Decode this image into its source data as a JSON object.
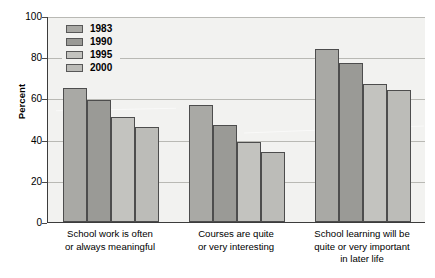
{
  "chart_data": {
    "type": "bar",
    "title": "",
    "xlabel": "",
    "ylabel": "Percent",
    "ylim": [
      0,
      100
    ],
    "yticks": [
      0,
      20,
      40,
      60,
      80,
      100
    ],
    "grid": true,
    "legend_position": "top-left inside plot",
    "categories": [
      "School work is often\nor always meaningful",
      "Courses are quite\nor very interesting",
      "School learning will be\nquite or very important\nin later life"
    ],
    "category_lines": [
      [
        "School work is often",
        "or always meaningful"
      ],
      [
        "Courses are quite",
        "or very interesting"
      ],
      [
        "School learning will be",
        "quite or very important",
        "in later life"
      ]
    ],
    "series": [
      {
        "name": "1983",
        "color": "#a9a9a5",
        "values": [
          65,
          57,
          84
        ]
      },
      {
        "name": "1990",
        "color": "#9a9a96",
        "values": [
          59,
          47,
          77
        ]
      },
      {
        "name": "1995",
        "color": "#c3c3bf",
        "values": [
          51,
          39,
          67
        ]
      },
      {
        "name": "2000",
        "color": "#bcbcb8",
        "values": [
          46,
          34,
          64
        ]
      }
    ]
  },
  "axes": {
    "y_title": "Percent",
    "y_tick_labels": [
      "100",
      "80",
      "60",
      "40",
      "20",
      "0"
    ]
  },
  "legend": {
    "items": [
      {
        "label": "1983"
      },
      {
        "label": "1990"
      },
      {
        "label": "1995"
      },
      {
        "label": "2000"
      }
    ]
  },
  "colors": {
    "plot_background": "#f2f2f0",
    "gridline": "#b9b9b4",
    "axis": "#3c3c3c",
    "bar_outline": "#4d4d4d"
  }
}
